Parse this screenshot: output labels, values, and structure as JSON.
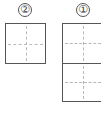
{
  "figure": {
    "type": "writing-grid",
    "panels": [
      {
        "label": "②",
        "cells": 1,
        "orientation": "vertical"
      },
      {
        "label": "①",
        "cells": 2,
        "orientation": "vertical"
      }
    ],
    "colors": {
      "border": "#555555",
      "guide": "#b8b8b8",
      "label": "#444444",
      "background": "#ffffff"
    }
  }
}
